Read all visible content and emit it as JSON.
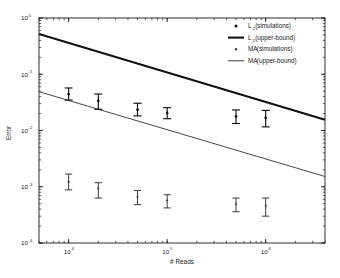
{
  "chart_data": {
    "type": "scatter",
    "title": "",
    "xlabel": "# Reads",
    "ylabel": "Error",
    "xscale": "log",
    "yscale": "log",
    "xlim": [
      5000,
      4000000
    ],
    "ylim": [
      0.0001,
      1
    ],
    "grid": false,
    "x_tick_labels": [
      "10",
      "10",
      "10"
    ],
    "x_tick_exponents": [
      "4",
      "5",
      "6"
    ],
    "x_tick_values": [
      10000,
      100000,
      1000000
    ],
    "y_tick_labels": [
      "10",
      "10",
      "10",
      "10",
      "10"
    ],
    "y_tick_exponents": [
      "0",
      "-1",
      "-2",
      "-3",
      "-4"
    ],
    "y_tick_values": [
      1,
      0.1,
      0.01,
      0.001,
      0.0001
    ],
    "legend_position": "top-right",
    "series": [
      {
        "name": "L_2 (simulations)",
        "label_base": "L",
        "label_sub": "2",
        "label_rest": " (simulations)",
        "type": "errorbar",
        "marker": "dot",
        "x": [
          10000,
          20000,
          50000,
          100000,
          500000,
          1000000
        ],
        "y": [
          0.0445,
          0.0335,
          0.0235,
          0.0205,
          0.0178,
          0.0168
        ],
        "y_upper": [
          0.057,
          0.0445,
          0.0305,
          0.0255,
          0.0232,
          0.0228
        ],
        "y_lower": [
          0.0348,
          0.0238,
          0.0182,
          0.0162,
          0.0133,
          0.0116
        ]
      },
      {
        "name": "L_2 (upper-bound)",
        "label_base": "L",
        "label_sub": "2",
        "label_rest": " (upper-bound)",
        "type": "line",
        "linewidth": "thick",
        "x": [
          5000,
          4000000
        ],
        "y": [
          0.52,
          0.0155
        ]
      },
      {
        "name": "MA (simulations)",
        "label_base": "MA",
        "label_sub": "",
        "label_rest": " (simulations)",
        "type": "errorbar",
        "marker": "dot",
        "x": [
          10000,
          20000,
          50000,
          100000,
          500000,
          1000000
        ],
        "y": [
          0.00122,
          0.00093,
          0.00066,
          0.00057,
          0.00049,
          0.00046
        ],
        "y_upper": [
          0.00168,
          0.00118,
          0.00086,
          0.00072,
          0.00063,
          0.00063
        ],
        "y_lower": [
          0.00088,
          0.00063,
          0.00048,
          0.00042,
          0.00036,
          0.0003
        ]
      },
      {
        "name": "MA (upper-bound)",
        "label_base": "MA",
        "label_sub": "",
        "label_rest": " (upper-bound)",
        "type": "line",
        "linewidth": "thin",
        "x": [
          5000,
          4000000
        ],
        "y": [
          0.049,
          0.00152
        ]
      }
    ]
  },
  "axes": {
    "y_label": "Error",
    "x_label": "# Reads"
  },
  "legend": {
    "entries": [
      {
        "text_base": "L",
        "text_sub": "2",
        "text_rest": " (simulations)",
        "glyph": "marker-dot-large"
      },
      {
        "text_base": "L",
        "text_sub": "2",
        "text_rest": " (upper-bound)",
        "glyph": "line-thick"
      },
      {
        "text_base": "MA",
        "text_sub": "",
        "text_rest": " (simulations)",
        "glyph": "marker-dot-small"
      },
      {
        "text_base": "MA",
        "text_sub": "",
        "text_rest": " (upper-bound)",
        "glyph": "line-thin"
      }
    ]
  },
  "colors": {
    "axis": "#1a1a1a",
    "l2_series": "#111111",
    "ma_series": "#3a3a3a",
    "background": "#ffffff"
  }
}
